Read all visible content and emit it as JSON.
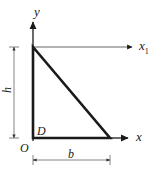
{
  "figure": {
    "background_color": "#ffffff",
    "line_color": "#1a1a1a",
    "thin_line_color": "#555555",
    "width": 160,
    "height": 177
  },
  "axes": {
    "y_axis": {
      "label": "y",
      "direction": "up",
      "origin_x": 33,
      "tip_y": 20,
      "base_y": 140
    },
    "x_axis": {
      "label": "x",
      "direction": "right",
      "origin_y": 138,
      "tip_x": 130
    },
    "x1_axis": {
      "label": "x",
      "label_subscript": "1",
      "direction": "right",
      "origin_y": 47,
      "start_x": 33,
      "tip_x": 134
    }
  },
  "shape": {
    "type": "right-triangle",
    "corner_label": "D",
    "vertices": [
      {
        "name": "top-left",
        "x": 33,
        "y": 47
      },
      {
        "name": "bottom-left",
        "x": 33,
        "y": 138
      },
      {
        "name": "bottom-right",
        "x": 110,
        "y": 138
      }
    ]
  },
  "dimensions": {
    "height": {
      "label": "h",
      "orientation": "vertical",
      "line_x": 14,
      "from_y": 47,
      "to_y": 138
    },
    "base": {
      "label": "b",
      "orientation": "horizontal",
      "line_y": 160,
      "from_x": 33,
      "to_x": 110
    }
  },
  "origin": {
    "label": "O",
    "x": 33,
    "y": 138
  }
}
